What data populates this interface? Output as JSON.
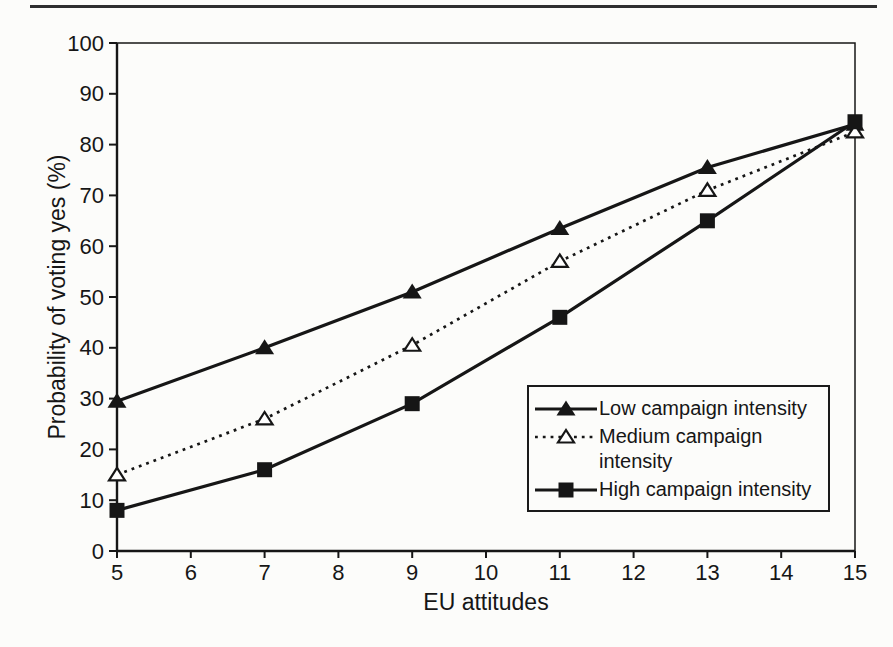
{
  "page": {
    "background": "#fcfcfa",
    "top_rule_color": "#2f2f2f",
    "ink_color": "#161616"
  },
  "chart_data": {
    "type": "line",
    "x": [
      5,
      7,
      9,
      11,
      13,
      15
    ],
    "series": [
      {
        "name": "Low campaign intensity",
        "marker": "triangle-filled",
        "line": "solid",
        "values": [
          29.5,
          40,
          51,
          63.5,
          75.5,
          84
        ]
      },
      {
        "name": "Medium campaign intensity",
        "marker": "triangle-open",
        "line": "dotted",
        "values": [
          15,
          26,
          40.5,
          57,
          71,
          82.5
        ]
      },
      {
        "name": "High campaign intensity",
        "marker": "square-filled",
        "line": "solid",
        "values": [
          8,
          16,
          29,
          46,
          65,
          84.5
        ]
      }
    ],
    "title": "",
    "xlabel": "EU attitudes",
    "ylabel": "Probability of voting yes (%)",
    "xlim": [
      5,
      15
    ],
    "ylim": [
      0,
      100
    ],
    "xticks": [
      5,
      6,
      7,
      8,
      9,
      10,
      11,
      12,
      13,
      14,
      15
    ],
    "yticks": [
      0,
      10,
      20,
      30,
      40,
      50,
      60,
      70,
      80,
      90,
      100
    ],
    "grid": false,
    "legend_position": "inside-lower-right",
    "line_color": "#161616"
  }
}
